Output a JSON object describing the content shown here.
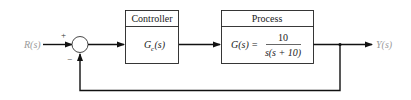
{
  "diagram": {
    "type": "feedback-control-block-diagram",
    "input_signal": "R(s)",
    "output_signal": "Y(s)",
    "summing_junction": {
      "plus_sign": "+",
      "minus_sign": "−"
    },
    "blocks": [
      {
        "title": "Controller",
        "transfer_function": {
          "lhs_main": "G",
          "lhs_sub": "c",
          "lhs_arg": "(s)"
        }
      },
      {
        "title": "Process",
        "transfer_function": {
          "lhs": "G(s) =",
          "numerator": "10",
          "denominator": "s(s + 10)"
        }
      }
    ],
    "feedback": "unity negative feedback"
  }
}
